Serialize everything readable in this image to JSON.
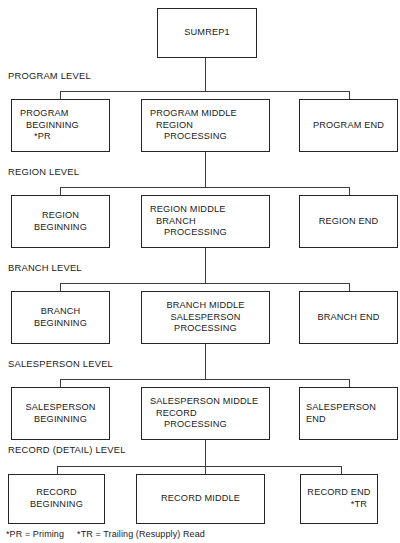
{
  "diagram": {
    "root": {
      "label": "SUMREP1"
    },
    "levels": [
      {
        "caption": "PROGRAM LEVEL",
        "beginning": {
          "line1": "PROGRAM",
          "line2": "BEGINNING",
          "line3": "*PR"
        },
        "middle": {
          "line1": "PROGRAM MIDDLE",
          "line2": "REGION",
          "line3": "PROCESSING"
        },
        "end": {
          "line1": "PROGRAM END",
          "line2": "",
          "line3": ""
        }
      },
      {
        "caption": "REGION LEVEL",
        "beginning": {
          "line1": "REGION",
          "line2": "BEGINNING",
          "line3": ""
        },
        "middle": {
          "line1": "REGION MIDDLE",
          "line2": "BRANCH",
          "line3": "PROCESSING"
        },
        "end": {
          "line1": "REGION END",
          "line2": "",
          "line3": ""
        }
      },
      {
        "caption": "BRANCH LEVEL",
        "beginning": {
          "line1": "BRANCH",
          "line2": "BEGINNING",
          "line3": ""
        },
        "middle": {
          "line1": "BRANCH MIDDLE",
          "line2": "SALESPERSON",
          "line3": "PROCESSING"
        },
        "end": {
          "line1": "BRANCH END",
          "line2": "",
          "line3": ""
        }
      },
      {
        "caption": "SALESPERSON LEVEL",
        "beginning": {
          "line1": "SALESPERSON",
          "line2": "BEGINNING",
          "line3": ""
        },
        "middle": {
          "line1": "SALESPERSON MIDDLE",
          "line2": "RECORD",
          "line3": "PROCESSING"
        },
        "end": {
          "line1": "SALESPERSON",
          "line2": "END",
          "line3": ""
        }
      },
      {
        "caption": "RECORD (DETAIL) LEVEL",
        "beginning": {
          "line1": "RECORD",
          "line2": "BEGINNING",
          "line3": ""
        },
        "middle": {
          "line1": "RECORD MIDDLE",
          "line2": "",
          "line3": ""
        },
        "end": {
          "line1": "RECORD END",
          "line2": "*TR",
          "line3": ""
        }
      }
    ],
    "footnote": "*PR = Priming     *TR = Trailing (Resupply) Read",
    "colors": {
      "box_border": "#262626",
      "line": "#3a3a3a",
      "text": "#1a1a1a",
      "background": "#ffffff"
    }
  }
}
